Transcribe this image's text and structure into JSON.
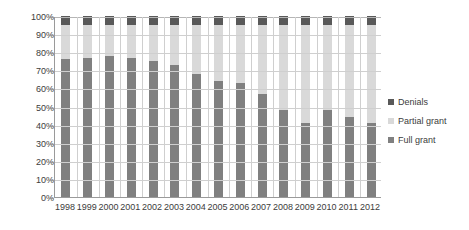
{
  "chart_data": {
    "type": "bar",
    "title": "",
    "subtitle": "",
    "xlabel": "",
    "ylabel": "",
    "stacked": true,
    "stack_mode": "percent",
    "grid": true,
    "legend_position": "right",
    "ylim": [
      0,
      100
    ],
    "ytick_labels": [
      "100%",
      "90%",
      "80%",
      "70%",
      "60%",
      "50%",
      "40%",
      "30%",
      "20%",
      "10%",
      "0%"
    ],
    "ytick_values": [
      100,
      90,
      80,
      70,
      60,
      50,
      40,
      30,
      20,
      10,
      0
    ],
    "categories": [
      "1998",
      "1999",
      "2000",
      "2001",
      "2002",
      "2003",
      "2004",
      "2005",
      "2006",
      "2007",
      "2008",
      "2009",
      "2010",
      "2011",
      "2012"
    ],
    "series": [
      {
        "name": "Full grant",
        "color": "#808080",
        "values": [
          76,
          77,
          78,
          77,
          75,
          73,
          68,
          64,
          63,
          57,
          48,
          41,
          48,
          44,
          41
        ]
      },
      {
        "name": "Partial grant",
        "color": "#d9d9d9",
        "values": [
          19,
          18,
          17,
          18,
          20,
          22,
          27,
          31,
          32,
          38,
          47,
          54,
          47,
          51,
          54
        ]
      },
      {
        "name": "Denials",
        "color": "#595959",
        "values": [
          5,
          5,
          5,
          5,
          5,
          5,
          5,
          5,
          5,
          5,
          5,
          5,
          5,
          5,
          5
        ]
      }
    ],
    "legend_entries": [
      {
        "label": "Denials",
        "color": "#595959"
      },
      {
        "label": "Partial grant",
        "color": "#d9d9d9"
      },
      {
        "label": "Full grant",
        "color": "#808080"
      }
    ],
    "colors": {
      "denials": "#595959",
      "partial_grant": "#d9d9d9",
      "full_grant": "#808080",
      "gridline": "#cfcfcf",
      "axis": "#9a9a9a",
      "text": "#3c3c3c",
      "background": "#ffffff"
    }
  }
}
